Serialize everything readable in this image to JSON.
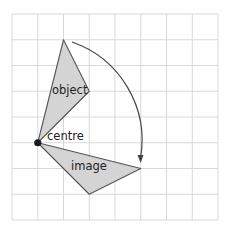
{
  "diagram": {
    "type": "rotation-grid",
    "grid": {
      "origin_px": [
        12,
        14
      ],
      "cell_px": 25.75,
      "cols": 8,
      "rows": 8,
      "line_color": "#d9d9d9"
    },
    "labels": {
      "object": "object",
      "centre": "centre",
      "image": "image"
    },
    "shapes": {
      "object": {
        "vertices_grid": [
          [
            2,
            1
          ],
          [
            3,
            3
          ],
          [
            1,
            5
          ]
        ],
        "fill": "#d4d4d4",
        "stroke": "#555555"
      },
      "image": {
        "vertices_grid": [
          [
            1,
            5
          ],
          [
            5,
            6
          ],
          [
            3,
            7
          ]
        ],
        "fill": "#d4d4d4",
        "stroke": "#555555"
      }
    },
    "centre_point_grid": [
      1,
      5
    ],
    "centre_point_color": "#1a1a1a",
    "arrow": {
      "description": "clockwise rotation arc from object to image",
      "color": "#444444"
    }
  }
}
